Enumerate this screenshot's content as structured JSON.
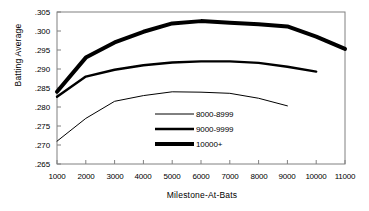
{
  "chart_data": {
    "type": "line",
    "title": "",
    "xlabel": "Milestone-At-Bats",
    "ylabel": "Batting Average",
    "xlim": [
      1000,
      11000
    ],
    "ylim": [
      0.265,
      0.305
    ],
    "grid": false,
    "legend_position": "center",
    "x_ticks": [
      "1000",
      "2000",
      "3000",
      "4000",
      "5000",
      "6000",
      "7000",
      "8000",
      "9000",
      "10000",
      "11000"
    ],
    "y_ticks": [
      ".265",
      ".270",
      ".275",
      ".280",
      ".285",
      ".290",
      ".295",
      ".300",
      ".305"
    ],
    "categories": [
      1000,
      2000,
      3000,
      4000,
      5000,
      6000,
      7000,
      8000,
      9000,
      10000,
      11000
    ],
    "series": [
      {
        "name": "8000-8999",
        "line_weight": "thin",
        "color": "#000000",
        "x": [
          1000,
          2000,
          3000,
          4000,
          5000,
          6000,
          7000,
          8000,
          9000
        ],
        "values": [
          0.271,
          0.277,
          0.2815,
          0.283,
          0.284,
          0.2839,
          0.2836,
          0.2823,
          0.2803
        ]
      },
      {
        "name": "9000-9999",
        "line_weight": "medium",
        "color": "#000000",
        "x": [
          1000,
          2000,
          3000,
          4000,
          5000,
          6000,
          7000,
          8000,
          9000,
          10000
        ],
        "values": [
          0.2827,
          0.288,
          0.2898,
          0.291,
          0.2917,
          0.292,
          0.292,
          0.2916,
          0.2906,
          0.2893
        ]
      },
      {
        "name": "10000+",
        "line_weight": "thick",
        "color": "#000000",
        "x": [
          1000,
          2000,
          3000,
          4000,
          5000,
          6000,
          7000,
          8000,
          9000,
          10000,
          11000
        ],
        "values": [
          0.284,
          0.293,
          0.297,
          0.2998,
          0.302,
          0.3026,
          0.3022,
          0.3018,
          0.3012,
          0.2985,
          0.2953
        ]
      }
    ]
  },
  "axes": {
    "y_title": "Batting Average",
    "x_title": "Milestone-At-Bats",
    "y_tick_labels": [
      ".305",
      ".300",
      ".295",
      ".290",
      ".285",
      ".280",
      ".275",
      ".270",
      ".265"
    ],
    "x_tick_labels": [
      "1000",
      "2000",
      "3000",
      "4000",
      "5000",
      "6000",
      "7000",
      "8000",
      "9000",
      "10000",
      "11000"
    ]
  },
  "legend": {
    "items": [
      {
        "label": "8000-8999"
      },
      {
        "label": "9000-9999"
      },
      {
        "label": "10000+"
      }
    ]
  },
  "colors": {
    "line": "#000000",
    "axis": "#808080",
    "background": "#ffffff"
  }
}
